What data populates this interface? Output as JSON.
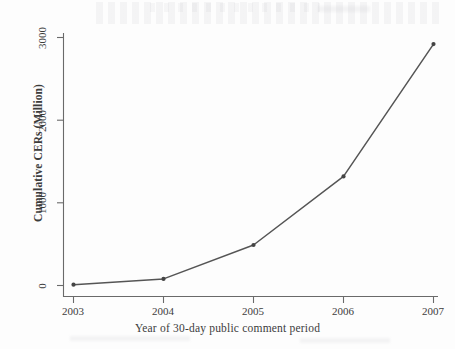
{
  "chart_data": {
    "type": "line",
    "title": "",
    "xlabel": "Year of 30-day public comment period",
    "ylabel": "Cumulative CERs (Million)",
    "categories": [
      "2003",
      "2004",
      "2005",
      "2006",
      "2007"
    ],
    "x": [
      2003,
      2004,
      2005,
      2006,
      2007
    ],
    "values": [
      10,
      80,
      490,
      1320,
      2920
    ],
    "series": [
      {
        "name": "Cumulative CERs",
        "values": [
          10,
          80,
          490,
          1320,
          2920
        ]
      }
    ],
    "xlim": [
      2003,
      2007
    ],
    "ylim": [
      0,
      3000
    ],
    "ytick_labels": [
      "0",
      "1000",
      "2000",
      "3000"
    ],
    "ytick_values": [
      0,
      1000,
      2000,
      3000
    ],
    "xtick_labels": [
      "2003",
      "2004",
      "2005",
      "2006",
      "2007"
    ],
    "grid": false,
    "legend": "none",
    "marker": "filled-circle",
    "line_color": "#555555",
    "marker_color": "#444444",
    "axis_color": "#6a6a6a",
    "background_color": "#fdfdfd"
  }
}
